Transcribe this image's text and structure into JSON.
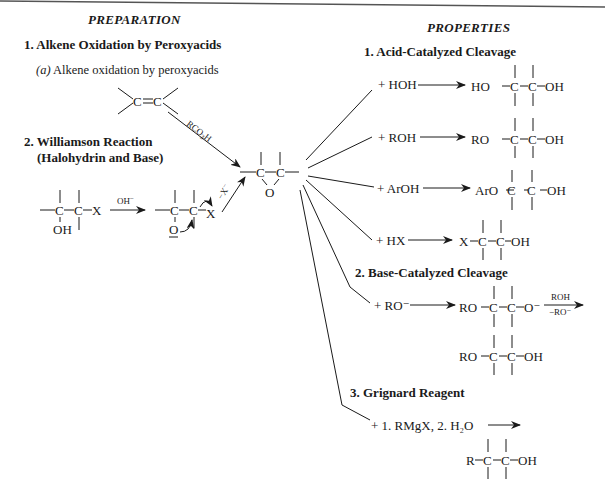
{
  "preparation": {
    "heading": "PREPARATION",
    "sections": [
      {
        "number": "1.",
        "title": "Alkene Oxidation by Peroxyacids",
        "sub": {
          "label": "(a)",
          "text": "Alkene oxidation by peroxyacids"
        },
        "reagent": "RCO3H"
      },
      {
        "number": "2.",
        "title_line1": "Williamson Reaction",
        "title_line2": "(Halohydrin and Base)",
        "halohydrin": {
          "left": "C",
          "right": "C",
          "x": "X",
          "oh": "OH"
        },
        "reagent": "OH⁻",
        "alkoxide": {
          "o": "O",
          "x": "X"
        },
        "leaving": "−X⁻"
      }
    ]
  },
  "epoxide": {
    "c1": "C",
    "c2": "C",
    "o": "O"
  },
  "properties": {
    "heading": "PROPERTIES",
    "acid": {
      "title": "1.  Acid-Catalyzed Cleavage",
      "rows": [
        {
          "reagent": "+ HOH",
          "left": "HO",
          "right": "OH"
        },
        {
          "reagent": "+ ROH",
          "left": "RO",
          "right": "OH"
        },
        {
          "reagent": "+ ArOH",
          "left": "ArO",
          "right": "OH"
        },
        {
          "reagent": "+ HX",
          "left": "X",
          "right": "OH"
        }
      ]
    },
    "base": {
      "title": "2.  Base-Catalyzed Cleavage",
      "reagent": "+ RO⁻",
      "intermediate": {
        "left": "RO",
        "right": "O⁻"
      },
      "arrow_top": "ROH",
      "arrow_bottom": "−RO⁻",
      "product": {
        "left": "RO",
        "right": "OH"
      }
    },
    "grignard": {
      "title": "3.  Grignard Reagent",
      "reagent": "+ 1.  RMgX,  2.  H₂O",
      "product": {
        "left": "R",
        "right": "OH"
      }
    }
  }
}
